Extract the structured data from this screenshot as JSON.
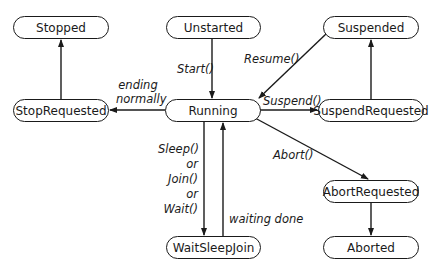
{
  "diagram": {
    "type": "state-machine",
    "states": {
      "stopped": "Stopped",
      "unstarted": "Unstarted",
      "suspended": "Suspended",
      "stop_requested": "StopRequested",
      "running": "Running",
      "suspend_requested": "SuspendRequested",
      "abort_requested": "AbortRequested",
      "wait_sleep_join": "WaitSleepJoin",
      "aborted": "Aborted"
    },
    "transitions": {
      "start": "Start()",
      "resume": "Resume()",
      "suspend": "Suspend()",
      "ending_1": "ending",
      "ending_2": "normally",
      "abort": "Abort()",
      "sleep": "Sleep()",
      "or1": "or",
      "join": "Join()",
      "or2": "or",
      "wait": "Wait()",
      "waiting_done": "waiting done"
    },
    "edges": [
      {
        "from": "Unstarted",
        "to": "Running",
        "label": "Start()"
      },
      {
        "from": "Running",
        "to": "StopRequested",
        "label": "ending normally"
      },
      {
        "from": "StopRequested",
        "to": "Stopped",
        "label": ""
      },
      {
        "from": "Suspended",
        "to": "Running",
        "label": "Resume()"
      },
      {
        "from": "Running",
        "to": "SuspendRequested",
        "label": "Suspend()"
      },
      {
        "from": "SuspendRequested",
        "to": "Suspended",
        "label": ""
      },
      {
        "from": "Running",
        "to": "AbortRequested",
        "label": "Abort()"
      },
      {
        "from": "AbortRequested",
        "to": "Aborted",
        "label": ""
      },
      {
        "from": "Running",
        "to": "WaitSleepJoin",
        "label": "Sleep() or Join() or Wait()"
      },
      {
        "from": "WaitSleepJoin",
        "to": "Running",
        "label": "waiting done"
      }
    ]
  }
}
